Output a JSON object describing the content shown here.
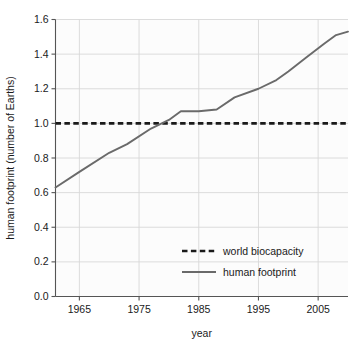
{
  "chart_data": {
    "type": "line",
    "title": "",
    "subtitle": "",
    "xlabel": "year",
    "ylabel": "human footprint (number of Earths)",
    "xlim": [
      1961,
      2010
    ],
    "ylim": [
      0.0,
      1.6
    ],
    "xticks": [
      1965,
      1975,
      1985,
      1995,
      2005
    ],
    "xticklabels": [
      "1965",
      "1975",
      "1985",
      "1995",
      "2005"
    ],
    "yticks": [
      0.0,
      0.2,
      0.4,
      0.6,
      0.8,
      1.0,
      1.2,
      1.4,
      1.6
    ],
    "yticklabels": [
      "0.0",
      "0.2",
      "0.4",
      "0.6",
      "0.8",
      "1.0",
      "1.2",
      "1.4",
      "1.6"
    ],
    "grid": true,
    "grid_color": "#d8d8d8",
    "legend_position": "lower center",
    "series": [
      {
        "name": "world biocapacity",
        "style": "dashed",
        "color": "#1a1a1a",
        "x": [
          1961,
          2010
        ],
        "values": [
          1.0,
          1.0
        ]
      },
      {
        "name": "human footprint",
        "style": "solid",
        "color": "#6a6a6a",
        "x": [
          1961,
          1965,
          1970,
          1973,
          1977,
          1980,
          1982,
          1985,
          1988,
          1991,
          1995,
          1998,
          2000,
          2003,
          2006,
          2008,
          2010
        ],
        "values": [
          0.63,
          0.72,
          0.83,
          0.88,
          0.97,
          1.02,
          1.07,
          1.07,
          1.08,
          1.15,
          1.2,
          1.25,
          1.3,
          1.38,
          1.46,
          1.51,
          1.53
        ]
      }
    ]
  },
  "legend": {
    "items": [
      {
        "label": "world biocapacity",
        "style": "dashed",
        "color": "#1a1a1a"
      },
      {
        "label": "human footprint",
        "style": "solid",
        "color": "#6a6a6a"
      }
    ]
  },
  "axes": {
    "x_title": "year",
    "y_title": "human footprint (number of Earths)"
  }
}
